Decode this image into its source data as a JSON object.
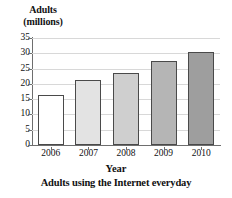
{
  "chart_data": {
    "type": "bar",
    "title": "Adults using the Internet everyday",
    "xlabel": "Year",
    "ylabel": "Adults (millions)",
    "ylabel_lines": [
      "Adults",
      "(millions)"
    ],
    "categories": [
      "2006",
      "2007",
      "2008",
      "2009",
      "2010"
    ],
    "values": [
      16.5,
      21.3,
      23.5,
      27.4,
      30.3
    ],
    "ylim": [
      0,
      35
    ],
    "ytick_labels": [
      "0",
      "5",
      "10",
      "15",
      "20",
      "25",
      "30",
      "35"
    ],
    "ytick_values": [
      0,
      5,
      10,
      15,
      20,
      25,
      30,
      35
    ],
    "grid": true,
    "legend": null,
    "bar_colors": [
      "#ffffff",
      "#e3e3e3",
      "#cfcfcf",
      "#b5b5b5",
      "#9e9e9e"
    ],
    "bar_edge_color": "#4a4a4a",
    "gridline_color": "#d8d8d8",
    "axis_color": "#6e6e6e"
  }
}
